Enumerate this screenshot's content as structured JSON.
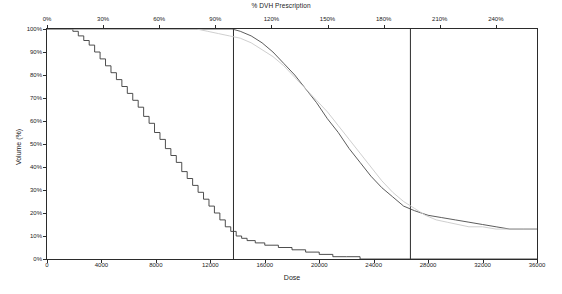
{
  "chart_data": {
    "type": "line",
    "title": "% DVH Prescription",
    "xlabel": "Dose",
    "ylabel": "Volume (%)",
    "grid": false,
    "legend": "none",
    "x_axis": {
      "label": "Dose",
      "min": 0,
      "max": 36000,
      "ticks": [
        0,
        4000,
        8000,
        12000,
        16000,
        20000,
        24000,
        28000,
        32000,
        36000
      ],
      "tick_labels": [
        "0",
        "4000",
        "8000",
        "12000",
        "16000",
        "20000",
        "24000",
        "28000",
        "32000",
        "36000"
      ]
    },
    "x_axis_top": {
      "label": "% DVH Prescription",
      "min": 0,
      "max": 262,
      "ticks": [
        0,
        30,
        60,
        90,
        120,
        150,
        180,
        210,
        240
      ],
      "tick_labels": [
        "0%",
        "30%",
        "60%",
        "90%",
        "120%",
        "150%",
        "180%",
        "210%",
        "240%"
      ]
    },
    "y_axis": {
      "label": "Volume (%)",
      "min": 0,
      "max": 100,
      "ticks": [
        0,
        10,
        20,
        30,
        40,
        50,
        60,
        70,
        80,
        90,
        100
      ],
      "tick_labels": [
        "0%",
        "10%",
        "20%",
        "30%",
        "40%",
        "50%",
        "60%",
        "70%",
        "80%",
        "90%",
        "100%"
      ]
    },
    "annotations": [
      {
        "type": "vertical-line",
        "x": 13700,
        "color": "#2b2b2b"
      },
      {
        "type": "vertical-line",
        "x": 26700,
        "color": "#2b2b2b"
      }
    ],
    "series": [
      {
        "name": "structure-1-staircase",
        "style": "step",
        "color": "#3a3a3a",
        "points": [
          [
            0,
            100
          ],
          [
            1500,
            100
          ],
          [
            1900,
            99
          ],
          [
            2300,
            97
          ],
          [
            2700,
            95
          ],
          [
            3100,
            93
          ],
          [
            3500,
            90
          ],
          [
            3900,
            87
          ],
          [
            4300,
            84
          ],
          [
            4700,
            81
          ],
          [
            5100,
            78
          ],
          [
            5500,
            75
          ],
          [
            5900,
            72
          ],
          [
            6300,
            69
          ],
          [
            6700,
            66
          ],
          [
            7100,
            62
          ],
          [
            7500,
            59
          ],
          [
            7900,
            55
          ],
          [
            8300,
            52
          ],
          [
            8700,
            48
          ],
          [
            9100,
            45
          ],
          [
            9500,
            42
          ],
          [
            9900,
            38
          ],
          [
            10300,
            35
          ],
          [
            10700,
            32
          ],
          [
            11100,
            29
          ],
          [
            11500,
            26
          ],
          [
            11900,
            23
          ],
          [
            12300,
            20
          ],
          [
            12700,
            17
          ],
          [
            13100,
            14
          ],
          [
            13500,
            12
          ],
          [
            13900,
            10
          ],
          [
            14300,
            9
          ],
          [
            14700,
            8
          ],
          [
            15300,
            7
          ],
          [
            16000,
            6
          ],
          [
            17000,
            5
          ],
          [
            18000,
            4
          ],
          [
            19000,
            3
          ],
          [
            20000,
            2
          ],
          [
            21000,
            1
          ],
          [
            22000,
            1
          ],
          [
            23000,
            0
          ],
          [
            36000,
            0
          ]
        ]
      },
      {
        "name": "structure-2-dark",
        "style": "smooth",
        "color": "#4a4a4a",
        "points": [
          [
            0,
            100
          ],
          [
            13600,
            100
          ],
          [
            14200,
            99
          ],
          [
            15000,
            97
          ],
          [
            15800,
            94
          ],
          [
            16600,
            90
          ],
          [
            17400,
            85
          ],
          [
            18200,
            80
          ],
          [
            19000,
            74
          ],
          [
            19800,
            68
          ],
          [
            20600,
            61
          ],
          [
            21400,
            55
          ],
          [
            22200,
            48
          ],
          [
            23000,
            42
          ],
          [
            23800,
            36
          ],
          [
            24600,
            31
          ],
          [
            25400,
            27
          ],
          [
            26200,
            23
          ],
          [
            27000,
            21
          ],
          [
            28000,
            19
          ],
          [
            29000,
            18
          ],
          [
            30000,
            17
          ],
          [
            31000,
            16
          ],
          [
            32000,
            15
          ],
          [
            33000,
            14
          ],
          [
            34000,
            13
          ],
          [
            35000,
            13
          ],
          [
            36000,
            13
          ]
        ]
      },
      {
        "name": "structure-3-light",
        "style": "smooth",
        "color": "#c9c9c9",
        "points": [
          [
            0,
            100
          ],
          [
            11000,
            100
          ],
          [
            11800,
            99
          ],
          [
            12600,
            98
          ],
          [
            13400,
            97
          ],
          [
            14200,
            96
          ],
          [
            15000,
            94
          ],
          [
            15800,
            91
          ],
          [
            16600,
            88
          ],
          [
            17400,
            84
          ],
          [
            18200,
            79
          ],
          [
            19000,
            74
          ],
          [
            19800,
            69
          ],
          [
            20600,
            64
          ],
          [
            21400,
            58
          ],
          [
            22200,
            52
          ],
          [
            23000,
            46
          ],
          [
            23800,
            40
          ],
          [
            24600,
            34
          ],
          [
            25400,
            29
          ],
          [
            26200,
            25
          ],
          [
            27000,
            22
          ],
          [
            27800,
            19
          ],
          [
            28600,
            17
          ],
          [
            29400,
            16
          ],
          [
            30200,
            15
          ],
          [
            31000,
            14
          ],
          [
            32000,
            14
          ],
          [
            33000,
            13
          ],
          [
            34000,
            13
          ],
          [
            35000,
            13
          ],
          [
            36000,
            13
          ]
        ]
      }
    ]
  }
}
